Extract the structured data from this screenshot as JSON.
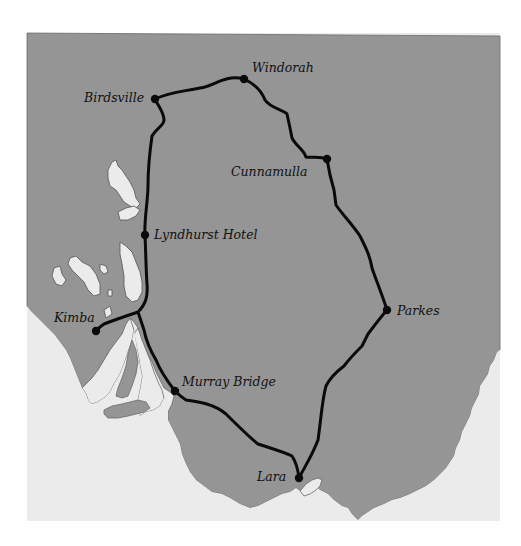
{
  "map": {
    "colors": {
      "background": "#ffffff",
      "land": "#959595",
      "sea": "#ebebeb",
      "route": "#0a0a0a",
      "coast_outline": "#555555"
    },
    "route_stops": [
      {
        "name": "Windorah",
        "x": 244,
        "y": 79
      },
      {
        "name": "Birdsville",
        "x": 155,
        "y": 99
      },
      {
        "name": "Cunnamulla",
        "x": 327,
        "y": 159
      },
      {
        "name": "Lyndhurst Hotel",
        "x": 145,
        "y": 235
      },
      {
        "name": "Parkes",
        "x": 387,
        "y": 310
      },
      {
        "name": "Kimba",
        "x": 96,
        "y": 331
      },
      {
        "name": "Murray Bridge",
        "x": 175,
        "y": 391
      },
      {
        "name": "Lara",
        "x": 299,
        "y": 478
      }
    ],
    "labels": {
      "windorah": "Windorah",
      "birdsville": "Birdsville",
      "cunnamulla": "Cunnamulla",
      "lyndhurst": "Lyndhurst Hotel",
      "parkes": "Parkes",
      "kimba": "Kimba",
      "murray_bridge": "Murray Bridge",
      "lara": "Lara"
    }
  }
}
